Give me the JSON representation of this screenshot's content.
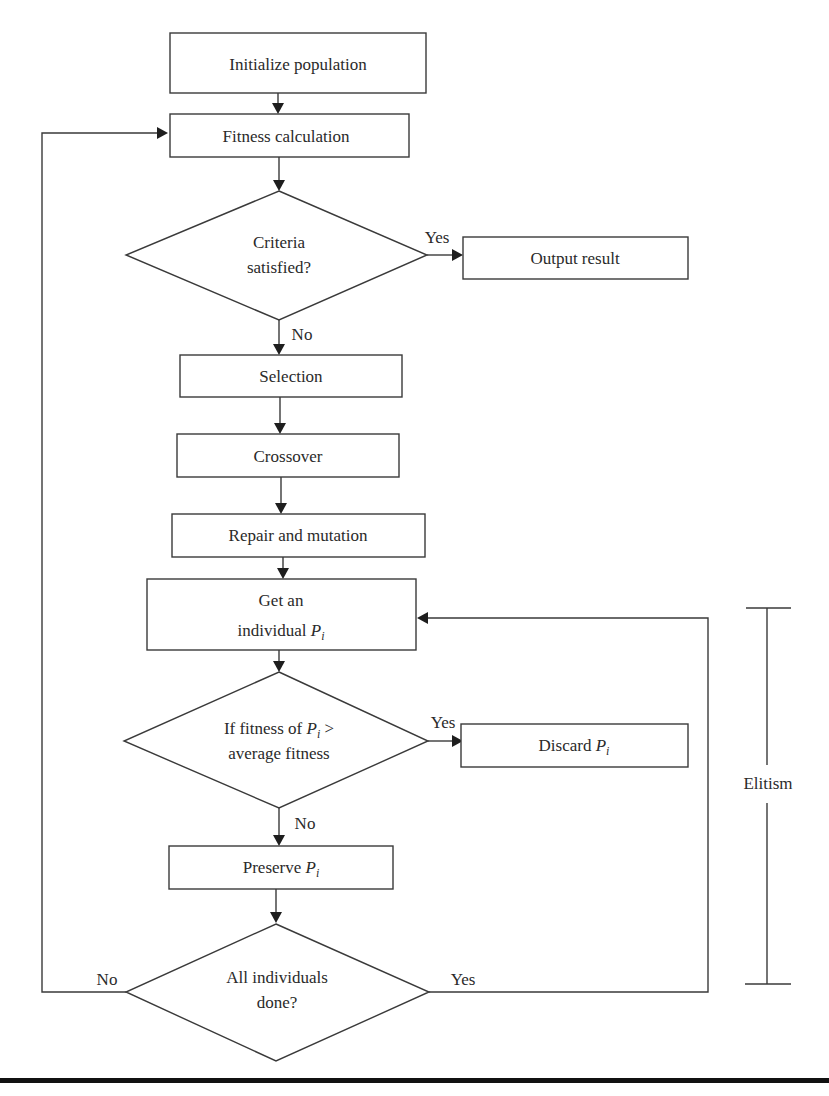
{
  "diagram": {
    "type": "flowchart",
    "nodes": {
      "init": {
        "label": "Initialize population"
      },
      "fitness": {
        "label": "Fitness calculation"
      },
      "criteria": {
        "line1": "Criteria",
        "line2": "satisfied?"
      },
      "output": {
        "label": "Output result"
      },
      "selection": {
        "label": "Selection"
      },
      "crossover": {
        "label": "Crossover"
      },
      "repair": {
        "label": "Repair and mutation"
      },
      "get": {
        "line1": "Get an",
        "line2": "individual ",
        "var": "P",
        "sub": "i"
      },
      "iffit": {
        "line1_pre": "If fitness of ",
        "var": "P",
        "sub": "i",
        "line1_post": " >",
        "line2": "average fitness"
      },
      "discard": {
        "label": "Discard ",
        "var": "P",
        "sub": "i"
      },
      "preserve": {
        "label": "Preserve ",
        "var": "P",
        "sub": "i"
      },
      "alldone": {
        "line1": "All individuals",
        "line2": "done?"
      }
    },
    "edge_labels": {
      "criteria_yes": "Yes",
      "criteria_no": "No",
      "iffit_yes": "Yes",
      "iffit_no": "No",
      "alldone_no": "No",
      "alldone_yes": "Yes"
    },
    "bracket": {
      "label": "Elitism"
    },
    "colors": {
      "stroke": "#3a3a3a",
      "text": "#2a2a2a",
      "rule": "#111111"
    }
  }
}
